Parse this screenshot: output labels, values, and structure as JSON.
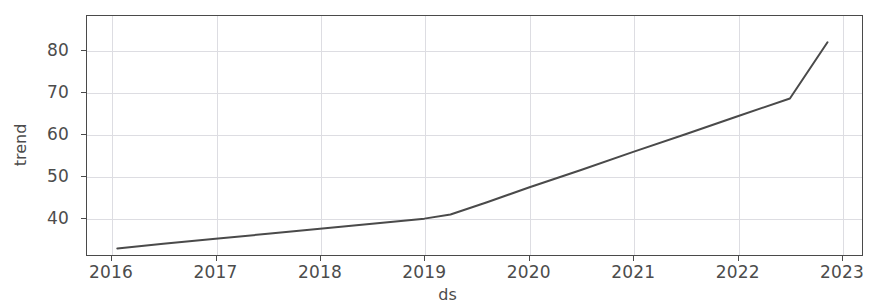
{
  "chart_data": {
    "type": "line",
    "title": "",
    "xlabel": "ds",
    "ylabel": "trend",
    "xlim": [
      2015.76,
      2023.2
    ],
    "ylim": [
      31.0,
      88.4
    ],
    "grid": true,
    "legend": false,
    "xticklabels": [
      "2016",
      "2017",
      "2018",
      "2019",
      "2020",
      "2021",
      "2022",
      "2023"
    ],
    "xtickvalues": [
      2016,
      2017,
      2018,
      2019,
      2020,
      2021,
      2022,
      2023
    ],
    "yticklabels": [
      "40",
      "50",
      "60",
      "70",
      "80"
    ],
    "ytickvalues": [
      40,
      50,
      60,
      70,
      80
    ],
    "line_color": "#4a4a4a",
    "line_width": 2,
    "series": [
      {
        "name": "trend",
        "x": [
          2016.06,
          2016.5,
          2017.0,
          2017.5,
          2018.0,
          2018.5,
          2019.0,
          2019.25,
          2019.6,
          2020.0,
          2020.5,
          2021.0,
          2021.5,
          2022.0,
          2022.5,
          2022.86
        ],
        "y": [
          32.8,
          33.9,
          35.1,
          36.3,
          37.5,
          38.7,
          39.9,
          40.9,
          43.8,
          47.3,
          51.5,
          55.8,
          60.0,
          64.3,
          68.5,
          81.9
        ]
      }
    ]
  },
  "axis": {
    "xlabel": "ds",
    "ylabel": "trend"
  }
}
